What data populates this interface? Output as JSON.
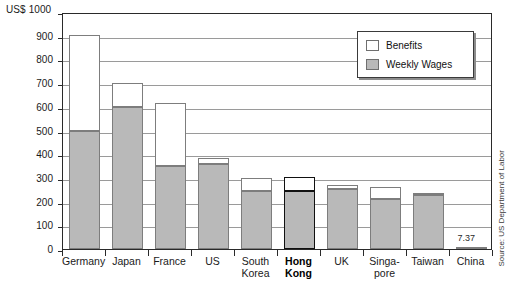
{
  "chart_data": {
    "type": "bar",
    "stacked": true,
    "title": "",
    "unit_label": "US$ 1000",
    "ylabel": "US$",
    "xlabel": "",
    "ylim": [
      0,
      1000
    ],
    "yticks": [
      0,
      100,
      200,
      300,
      400,
      500,
      600,
      700,
      800,
      900,
      1000
    ],
    "ytick_labels": [
      "0",
      "100",
      "200",
      "300",
      "400",
      "500",
      "600",
      "700",
      "800",
      "900",
      "US$ 1000"
    ],
    "grid": true,
    "grid_axis": "y",
    "legend_position": "upper-right",
    "categories": [
      "Germany",
      "Japan",
      "France",
      "US",
      "South\nKorea",
      "Hong\nKong",
      "UK",
      "Singa-\npore",
      "Taiwan",
      "China"
    ],
    "series": [
      {
        "name": "Weekly Wages",
        "color": "#b9b9b9",
        "values": [
          500,
          600,
          350,
          358,
          245,
          245,
          255,
          210,
          228,
          7.37
        ]
      },
      {
        "name": "Benefits",
        "color": "#ffffff",
        "values": [
          405,
          100,
          265,
          27,
          55,
          57,
          17,
          52,
          10,
          0
        ]
      }
    ],
    "totals": [
      905,
      700,
      615,
      385,
      300,
      302,
      272,
      262,
      238,
      7.37
    ],
    "annotations": [
      {
        "text": "7.37",
        "category": "China",
        "value": 7.37
      }
    ],
    "highlight_category": "Hong\nKong",
    "source": "Source: US Department of Labor"
  },
  "legend": {
    "items": [
      {
        "label": "Benefits",
        "swatch": "benefits"
      },
      {
        "label": "Weekly Wages",
        "swatch": "wages"
      }
    ]
  }
}
